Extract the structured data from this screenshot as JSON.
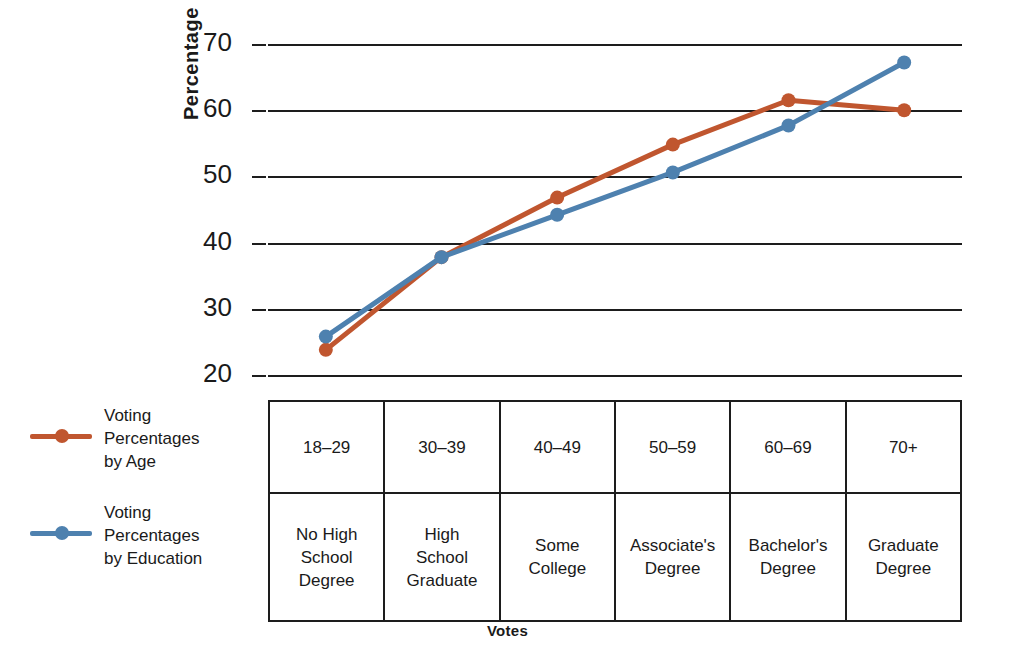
{
  "chart_data": {
    "type": "line",
    "title": "",
    "xlabel": "Votes",
    "ylabel": "Percentage",
    "ylim": [
      20,
      70
    ],
    "yticks": [
      70,
      60,
      50,
      40,
      30,
      20
    ],
    "grid": true,
    "legend_position": "left",
    "categories": [
      "18–29",
      "30–39",
      "40–49",
      "50–59",
      "60–69",
      "70+"
    ],
    "categories_secondary": [
      "No High\nSchool\nDegree",
      "High\nSchool\nGraduate",
      "Some\nCollege",
      "Associate's\nDegree",
      "Bachelor's\nDegree",
      "Graduate\nDegree"
    ],
    "series": [
      {
        "name": "Voting\nPercentages\nby Age",
        "color": "#c0562f",
        "values": [
          23.8,
          37.8,
          46.8,
          54.8,
          61.5,
          60.0
        ]
      },
      {
        "name": "Voting\nPercentages\nby Education",
        "color": "#4e81af",
        "values": [
          25.8,
          37.8,
          44.2,
          50.6,
          57.7,
          67.2
        ]
      }
    ]
  },
  "axis": {
    "y_label": "Percentage",
    "x_label": "Votes",
    "y_ticks": [
      "70",
      "60",
      "50",
      "40",
      "30",
      "20"
    ]
  },
  "legend": {
    "items": [
      {
        "label": "Voting\nPercentages\nby Age",
        "color": "#c0562f"
      },
      {
        "label": "Voting\nPercentages\nby Education",
        "color": "#4e81af"
      }
    ]
  },
  "table": {
    "rows": [
      {
        "name": "age-row",
        "cells": [
          "18–29",
          "30–39",
          "40–49",
          "50–59",
          "60–69",
          "70+"
        ]
      },
      {
        "name": "education-row",
        "cells": [
          "No High\nSchool\nDegree",
          "High\nSchool\nGraduate",
          "Some\nCollege",
          "Associate's\nDegree",
          "Bachelor's\nDegree",
          "Graduate\nDegree"
        ]
      }
    ]
  },
  "colors": {
    "age_series": "#c0562f",
    "education_series": "#4e81af",
    "grid": "#1d1d1d",
    "text": "#1a1a1a",
    "background": "#ffffff"
  }
}
